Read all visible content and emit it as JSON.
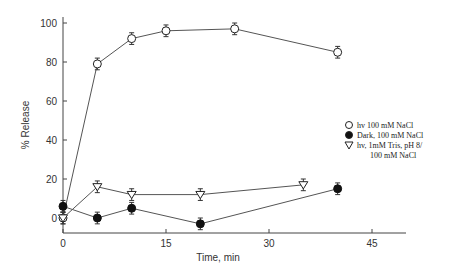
{
  "chart_data": {
    "type": "line",
    "title": "",
    "xlabel": "Time, min",
    "ylabel": "% Release",
    "xlim": [
      0,
      50
    ],
    "ylim": [
      -8,
      105
    ],
    "xticks": [
      0,
      15,
      30,
      45
    ],
    "yticks": [
      0,
      20,
      40,
      60,
      80,
      100
    ],
    "grid": false,
    "legend_position": "right",
    "series": [
      {
        "name": "hv 100 mM NaCl",
        "marker": "open-circle",
        "x": [
          0,
          5,
          10,
          15,
          25,
          40
        ],
        "y": [
          0,
          79,
          92,
          96,
          97,
          85
        ],
        "err": [
          3,
          3,
          3,
          3,
          3,
          3
        ]
      },
      {
        "name": "Dark, 100 mM NaCl",
        "marker": "filled-circle",
        "x": [
          0,
          5,
          10,
          20,
          40
        ],
        "y": [
          6,
          0,
          5,
          -3,
          15
        ],
        "err": [
          3,
          3,
          3,
          3,
          3
        ]
      },
      {
        "name": "hv, 1mM Tris, pH 8/ 100 mM NaCl",
        "marker": "open-triangle-down",
        "x": [
          0,
          5,
          10,
          20,
          35
        ],
        "y": [
          0,
          16,
          12,
          12,
          17
        ],
        "err": [
          3,
          3,
          3,
          3,
          3
        ]
      }
    ]
  },
  "legend": {
    "items": [
      {
        "label": "hv 100 mM NaCl"
      },
      {
        "label": "Dark, 100 mM NaCl"
      },
      {
        "label": "hv, 1mM Tris, pH 8/",
        "label2": "100 mM NaCl"
      }
    ]
  },
  "axes": {
    "x_title": "Time, min",
    "y_title": "% Release",
    "x_tick_labels": [
      "0",
      "15",
      "30",
      "45"
    ],
    "y_tick_labels": [
      "0",
      "20",
      "40",
      "60",
      "80",
      "100"
    ]
  }
}
